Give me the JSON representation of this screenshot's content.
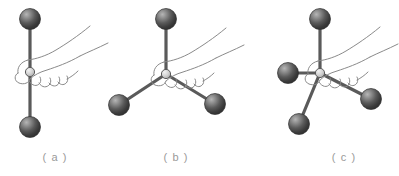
{
  "figure": {
    "background_color": "#ffffff",
    "width": 399,
    "height": 176,
    "sphere": {
      "icon": "sphere-atom-icon",
      "radius": 10.5,
      "fill_dark": "#3a3a3a",
      "fill_mid": "#5e5e5e",
      "fill_light": "#9d9d9d",
      "outline": "#2b2b2b"
    },
    "bond": {
      "icon": "bond-rod-icon",
      "color": "#5a5a5a",
      "width": 3.2
    },
    "hub": {
      "icon": "hub-joint-icon",
      "fill": "#d9d9d9",
      "stroke": "#555555"
    },
    "hand": {
      "icon": "hand-grip-icon",
      "stroke": "#8a8a8a",
      "stroke_width": 1
    }
  },
  "panels": [
    {
      "id": "panel-a",
      "label": "( a )",
      "label_x": 55,
      "label_y": 161,
      "geometry": "linear",
      "bond_count": 2,
      "center": {
        "x": 30,
        "y": 72
      },
      "atoms": [
        {
          "name": "atom-top",
          "x": 30,
          "y": 19
        },
        {
          "name": "atom-bottom",
          "x": 30,
          "y": 127
        }
      ],
      "hand_origin": {
        "x": 30,
        "y": 72
      }
    },
    {
      "id": "panel-b",
      "label": "( b )",
      "label_x": 176,
      "label_y": 161,
      "geometry": "trigonal-planar",
      "bond_count": 3,
      "center": {
        "x": 166,
        "y": 74
      },
      "atoms": [
        {
          "name": "atom-top",
          "x": 166,
          "y": 19
        },
        {
          "name": "atom-lower-left",
          "x": 119,
          "y": 105
        },
        {
          "name": "atom-lower-right",
          "x": 215,
          "y": 104
        }
      ],
      "hand_origin": {
        "x": 166,
        "y": 74
      }
    },
    {
      "id": "panel-c",
      "label": "( c )",
      "label_x": 344,
      "label_y": 161,
      "geometry": "tetrahedral",
      "bond_count": 4,
      "center": {
        "x": 320,
        "y": 73
      },
      "atoms": [
        {
          "name": "atom-top",
          "x": 320,
          "y": 19
        },
        {
          "name": "atom-left",
          "x": 288,
          "y": 73
        },
        {
          "name": "atom-lower-left",
          "x": 299,
          "y": 124
        },
        {
          "name": "atom-lower-right",
          "x": 371,
          "y": 99
        }
      ],
      "hand_origin": {
        "x": 320,
        "y": 73
      }
    }
  ]
}
